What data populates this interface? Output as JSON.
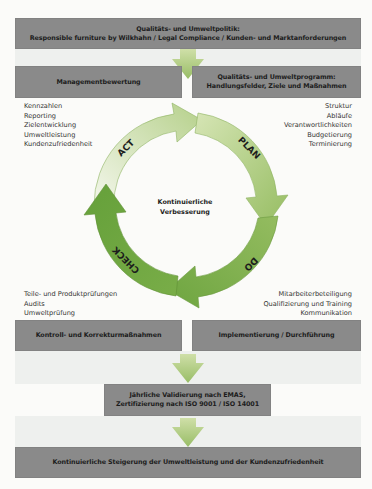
{
  "colors": {
    "box_fill": "#8a8a8a",
    "arrow_green_light": "#d9e6b8",
    "arrow_green_mid": "#a9c77a",
    "arrow_green_dark": "#6fa542",
    "band": "#eef0ee"
  },
  "top_box": {
    "line1": "Qualitäts- und Umweltpolitik:",
    "line2": "Responsible furniture by Wilkhahn / Legal Compliance / Kunden- und Marktanforderungen"
  },
  "management_box": {
    "label": "Managementbewertung"
  },
  "program_box": {
    "line1": "Qualitäts- und Umweltprogramm:",
    "line2": "Handlungsfelder, Ziele und Maßnahmen"
  },
  "left_top_list": [
    "Kennzahlen",
    "Reporting",
    "Zielentwicklung",
    "Umweltleistung",
    "Kundenzufriedenheit"
  ],
  "right_top_list": [
    "Struktur",
    "Abläufe",
    "Verantwortlichkeiten",
    "Budgetierung",
    "Terminierung"
  ],
  "cycle": {
    "center_line1": "Kontinuierliche",
    "center_line2": "Verbesserung",
    "segments": [
      {
        "label": "ACT"
      },
      {
        "label": "PLAN"
      },
      {
        "label": "DO"
      },
      {
        "label": "CHECK"
      }
    ]
  },
  "left_bottom_list": [
    "Teile- und Produktprüfungen",
    "Audits",
    "Umweltprüfung"
  ],
  "right_bottom_list": [
    "Mitarbeiterbeteiligung",
    "Qualifizierung und Training",
    "Kommunikation"
  ],
  "control_box": {
    "label": "Kontroll- und Korrekturmaßnahmen"
  },
  "implementation_box": {
    "label": "Implementierung / Durchführung"
  },
  "validation_box": {
    "line1": "Jährliche Validierung nach EMAS,",
    "line2": "Zertifizierung nach ISO 9001 / ISO 14001"
  },
  "final_box": {
    "label": "Kontinuierliche Steigerung der Umweltleistung und der Kundenzufriedenheit"
  }
}
